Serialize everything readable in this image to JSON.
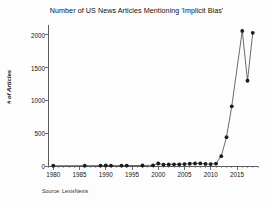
{
  "chart_data": {
    "type": "line",
    "title": "Number of US News Articles Mentioning 'Implicit Bias'",
    "xlabel": "",
    "ylabel": "# of Articles",
    "source": "Source: LexisNexis",
    "grid": false,
    "legend": "none",
    "xlim": [
      1979,
      2019
    ],
    "ylim": [
      0,
      2150
    ],
    "xticks": [
      1980,
      1985,
      1990,
      1995,
      2000,
      2005,
      2010,
      2015
    ],
    "xtick_labels": [
      "1980",
      "1985",
      "1990",
      "1995",
      "2000",
      "2005",
      "2010",
      "2015"
    ],
    "yticks": [
      0,
      500,
      1000,
      1500,
      2000
    ],
    "ytick_labels": [
      "0",
      "500",
      "1000",
      "1500",
      "2000"
    ],
    "x": [
      1980,
      1986,
      1989,
      1990,
      1991,
      1993,
      1994,
      1997,
      1999,
      2000,
      2001,
      2002,
      2003,
      2004,
      2005,
      2006,
      2007,
      2008,
      2009,
      2010,
      2011,
      2012,
      2013,
      2014,
      2016,
      2017,
      2018
    ],
    "values": [
      4,
      5,
      6,
      8,
      7,
      6,
      7,
      8,
      10,
      38,
      22,
      24,
      25,
      26,
      30,
      34,
      38,
      40,
      32,
      30,
      36,
      150,
      440,
      910,
      2060,
      1300,
      2030
    ],
    "series_color": "#1c1c1c",
    "marker": "circle"
  }
}
